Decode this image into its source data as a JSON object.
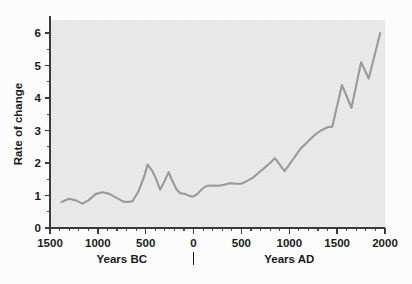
{
  "chart_data": {
    "type": "line",
    "title": "",
    "subtitle": "",
    "xlabel": "",
    "ylabel": "Rate of change",
    "xlabel_left": "Years BC",
    "xlabel_right": "Years AD",
    "xlim": [
      -1500,
      2000
    ],
    "ylim": [
      0,
      6.4
    ],
    "grid": false,
    "legend": "none",
    "line_color": "#9a9a9a",
    "plot_background": "#e9e9e9",
    "axis_color": "#3a3a3a",
    "x_tick_labels": [
      "1500",
      "1000",
      "500",
      "0",
      "500",
      "1000",
      "1500",
      "2000"
    ],
    "x_tick_values": [
      -1500,
      -1000,
      -500,
      0,
      500,
      1000,
      1500,
      2000
    ],
    "x_minor_interval": 100,
    "y_tick_labels": [
      "0",
      "1",
      "2",
      "3",
      "4",
      "5",
      "6"
    ],
    "y_tick_values": [
      0,
      1,
      2,
      3,
      4,
      5,
      6
    ],
    "y_minor_interval": 0.5,
    "series": [
      {
        "name": "Rate of change",
        "x": [
          -1380,
          -1300,
          -1230,
          -1160,
          -1100,
          -1020,
          -950,
          -880,
          -800,
          -740,
          -700,
          -640,
          -580,
          -520,
          -480,
          -430,
          -390,
          -350,
          -310,
          -260,
          -230,
          -180,
          -140,
          -90,
          -40,
          0,
          40,
          90,
          140,
          200,
          260,
          320,
          380,
          440,
          500,
          560,
          620,
          680,
          740,
          800,
          850,
          900,
          950,
          1000,
          1060,
          1120,
          1190,
          1260,
          1330,
          1400,
          1450,
          1550,
          1650,
          1750,
          1830,
          1950
        ],
        "y": [
          0.8,
          0.9,
          0.85,
          0.75,
          0.85,
          1.05,
          1.1,
          1.05,
          0.92,
          0.82,
          0.8,
          0.82,
          1.1,
          1.55,
          1.95,
          1.75,
          1.5,
          1.18,
          1.4,
          1.72,
          1.5,
          1.2,
          1.07,
          1.05,
          0.98,
          0.97,
          1.05,
          1.2,
          1.3,
          1.31,
          1.3,
          1.33,
          1.38,
          1.36,
          1.36,
          1.45,
          1.55,
          1.7,
          1.85,
          2.0,
          2.15,
          1.95,
          1.75,
          1.95,
          2.2,
          2.45,
          2.65,
          2.85,
          3.0,
          3.1,
          3.12,
          4.4,
          3.7,
          5.1,
          4.6,
          6.0
        ]
      }
    ]
  },
  "figure": {
    "alt": "Line chart of rate of change from 1500 BC to 2000 AD"
  }
}
